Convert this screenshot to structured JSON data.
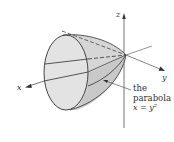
{
  "figure": {
    "type": "3d-surface-diagram",
    "axes": {
      "x_label": "x",
      "y_label": "y",
      "z_label": "z"
    },
    "annotation": {
      "line1": "the",
      "line2": "parabola",
      "equation": "x = y²"
    },
    "colors": {
      "surface_fill": "#d9d9d9",
      "face_fill": "#e2e2e2",
      "outline": "#444444",
      "axis": "#555555",
      "background": "#ffffff"
    }
  }
}
